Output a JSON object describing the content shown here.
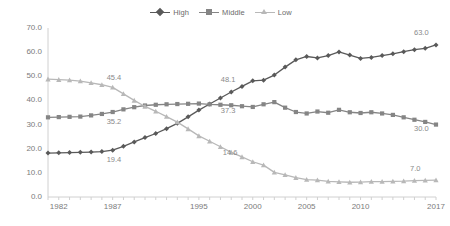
{
  "chart_data": {
    "type": "line",
    "title": "",
    "subtitle": "",
    "xlabel": "",
    "ylabel": "",
    "xlim": [
      1981,
      2017
    ],
    "ylim": [
      0.0,
      70.0
    ],
    "grid": false,
    "legend_position": "top-center",
    "yticks": [
      "70.0",
      "60.0",
      "50.0",
      "40.0",
      "30.0",
      "20.0",
      "10.0",
      "0.0"
    ],
    "ytick_values": [
      70,
      60,
      50,
      40,
      30,
      20,
      10,
      0
    ],
    "xticks": [
      "1982",
      "1987",
      "1995",
      "2000",
      "2005",
      "2010",
      "2017"
    ],
    "xtick_values": [
      1982,
      1987,
      1995,
      2000,
      2005,
      2010,
      2017
    ],
    "x": [
      1981,
      1982,
      1983,
      1984,
      1985,
      1986,
      1987,
      1988,
      1989,
      1990,
      1991,
      1992,
      1993,
      1994,
      1995,
      1996,
      1997,
      1998,
      1999,
      2000,
      2001,
      2002,
      2003,
      2004,
      2005,
      2006,
      2007,
      2008,
      2009,
      2010,
      2011,
      2012,
      2013,
      2014,
      2015,
      2016,
      2017
    ],
    "series": [
      {
        "name": "High",
        "color": "#595959",
        "marker": "diamond",
        "values": [
          18.2,
          18.3,
          18.4,
          18.5,
          18.6,
          18.8,
          19.4,
          21.0,
          22.8,
          24.6,
          26.3,
          28.3,
          30.5,
          33.2,
          36.0,
          38.5,
          41.0,
          43.5,
          45.8,
          48.1,
          48.4,
          50.5,
          53.8,
          56.8,
          58.2,
          57.6,
          58.6,
          60.1,
          58.8,
          57.4,
          57.8,
          58.6,
          59.3,
          60.2,
          61.0,
          61.6,
          63.0
        ]
      },
      {
        "name": "Middle",
        "color": "#858585",
        "marker": "square",
        "values": [
          33.0,
          33.1,
          33.2,
          33.3,
          33.8,
          34.4,
          35.2,
          36.3,
          37.2,
          37.9,
          38.2,
          38.4,
          38.5,
          38.6,
          38.7,
          38.4,
          38.2,
          38.0,
          37.6,
          37.3,
          38.4,
          39.3,
          37.0,
          35.2,
          34.6,
          35.4,
          34.9,
          36.1,
          35.1,
          34.8,
          35.1,
          34.6,
          34.0,
          33.0,
          32.0,
          31.1,
          30.0
        ]
      },
      {
        "name": "Low",
        "color": "#b8b8b8",
        "marker": "triangle",
        "values": [
          48.8,
          48.6,
          48.4,
          48.0,
          47.3,
          46.5,
          45.4,
          42.7,
          40.0,
          37.5,
          35.5,
          33.3,
          31.0,
          28.2,
          25.3,
          23.1,
          20.8,
          18.5,
          16.6,
          14.6,
          13.2,
          10.2,
          9.2,
          8.0,
          7.2,
          7.0,
          6.5,
          6.3,
          6.1,
          6.2,
          6.4,
          6.4,
          6.5,
          6.6,
          6.8,
          6.9,
          7.0
        ]
      }
    ],
    "point_labels": [
      {
        "series": "Low",
        "x": 1987,
        "value": "45.4"
      },
      {
        "series": "Middle",
        "x": 1987,
        "value": "35.2"
      },
      {
        "series": "High",
        "x": 1987,
        "value": "19.4"
      },
      {
        "series": "High",
        "x": 2000,
        "value": "48.1"
      },
      {
        "series": "Middle",
        "x": 2000,
        "value": "37.3"
      },
      {
        "series": "Low",
        "x": 2000,
        "value": "14.6"
      },
      {
        "series": "High",
        "x": 2017,
        "value": "63.0"
      },
      {
        "series": "Middle",
        "x": 2017,
        "value": "30.0"
      },
      {
        "series": "Low",
        "x": 2017,
        "value": "7.0"
      }
    ]
  },
  "legend": {
    "items": [
      {
        "label": "High",
        "icon": "diamond-marker-icon"
      },
      {
        "label": "Middle",
        "icon": "square-marker-icon"
      },
      {
        "label": "Low",
        "icon": "triangle-marker-icon"
      }
    ]
  }
}
